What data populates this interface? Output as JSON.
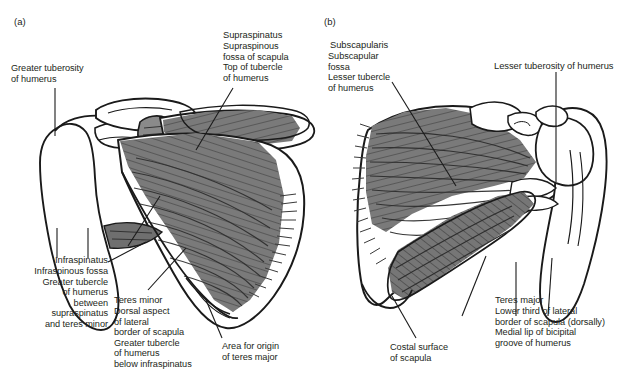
{
  "figure": {
    "type": "anatomical-illustration",
    "background_color": "#ffffff",
    "muscle_fill_color": "#7a7a7a",
    "bone_outline_color": "#1a1a1a",
    "text_color": "#231f20"
  },
  "panels": [
    {
      "id": "a",
      "letter": "(a)",
      "view": "dorsal / posterior aspect of scapula and humerus",
      "labels": [
        {
          "name": "greater-tuberosity",
          "heading": "Greater tuberosity",
          "lines": [
            "Greater tuberosity",
            "of humerus"
          ],
          "text": "Greater tuberosity\nof humerus"
        },
        {
          "name": "supraspinatus",
          "heading": "Supraspinatus",
          "lines": [
            "Supraspinatus",
            "Supraspinous",
            "fossa of scapula",
            "Top of tubercle",
            "of humerus"
          ],
          "text": "Supraspinous\nfossa of scapula\nTop of tubercle\nof humerus"
        },
        {
          "name": "infraspinatus",
          "heading": "Infraspinatus",
          "lines": [
            "Infraspinatus",
            "Infraspinous fossa",
            "Greater tubercle",
            "of humerus",
            "between",
            "supraspinatus",
            "and teres minor"
          ],
          "text": "Infraspinous fossa\nGreater tubercle\nof humerus\nbetween\nsupraspinatus\nand teres minor"
        },
        {
          "name": "teres-minor",
          "heading": "Teres minor",
          "lines": [
            "Teres minor",
            "Dorsal aspect",
            "of lateral",
            "border of scapula",
            "Greater tubercle",
            "of humerus",
            "below infraspinatus"
          ],
          "text": "Dorsal aspect\nof lateral\nborder of scapula\nGreater tubercle\nof humerus\nbelow infraspinatus"
        },
        {
          "name": "area-for-origin-of-teres-major",
          "heading": "Area for origin",
          "lines": [
            "Area for origin",
            "of teres major"
          ],
          "text": "Area for origin\nof teres major"
        }
      ]
    },
    {
      "id": "b",
      "letter": "(b)",
      "view": "ventral / costal aspect of scapula and humerus",
      "labels": [
        {
          "name": "subscapularis",
          "heading": "Subscapularis",
          "lines": [
            "Subscapularis",
            "Subscapular",
            "fossa",
            "Lesser tubercle",
            "of humerus"
          ],
          "text": "Subscapular\nfossa\nLesser tubercle\nof humerus"
        },
        {
          "name": "lesser-tuberosity",
          "heading": "Lesser tuberosity of humerus",
          "lines": [
            "Lesser tuberosity of humerus"
          ],
          "text": "Lesser tuberosity of humerus"
        },
        {
          "name": "costal-surface",
          "heading": "Costal surface",
          "lines": [
            "Costal surface",
            "of scapula"
          ],
          "text": "Costal surface\nof scapula"
        },
        {
          "name": "teres-major",
          "heading": "Teres major",
          "lines": [
            "Teres major",
            "Lower third of lateral",
            "border of scapula (dorsally)",
            "Medial lip of bicipital",
            "groove of humerus"
          ],
          "text": "Lower third of lateral\nborder of scapula (dorsally)\nMedial lip of bicipital\ngroove of humerus"
        }
      ]
    }
  ]
}
